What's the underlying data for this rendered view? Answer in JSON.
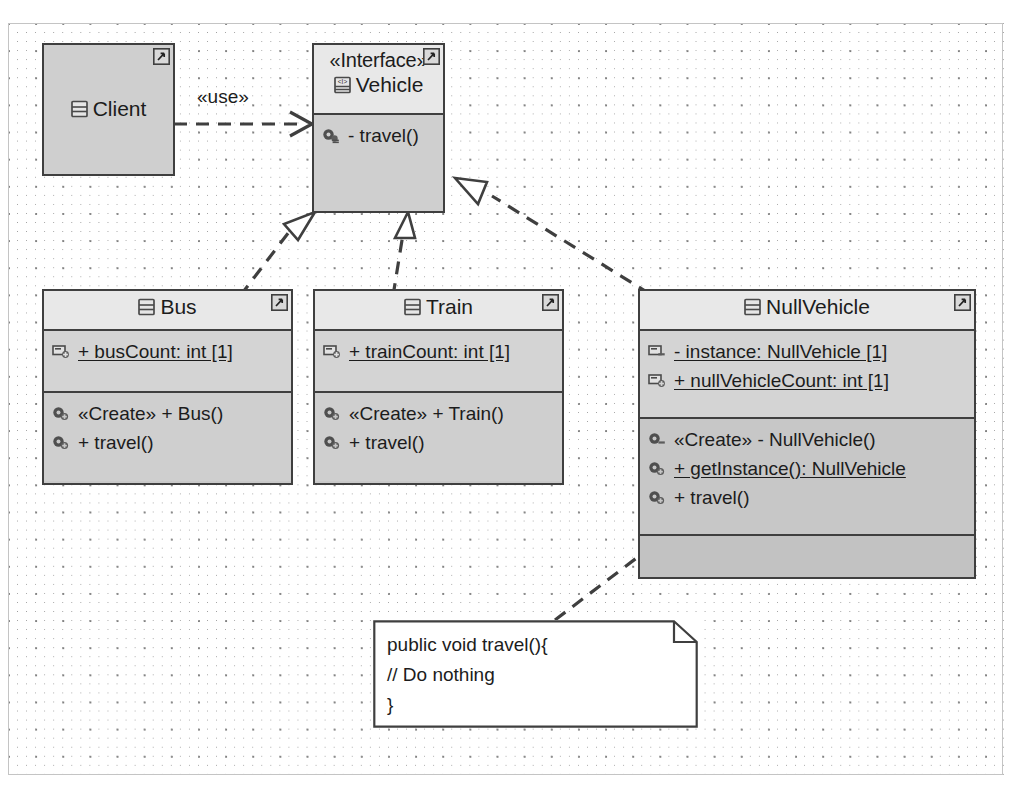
{
  "diagram": {
    "kind": "uml-class-diagram",
    "colors": {
      "class_fill": "#c9c9c9",
      "header_fill": "#e8e8e8",
      "attr_fill": "#d4d4d4",
      "op_fill": "#c7c7c7",
      "empty_fill": "#c2c2c2",
      "line": "#3f3f3f",
      "note_fill": "#ffffff",
      "grid_dot": "#6b6b6b"
    },
    "classes": [
      {
        "id": "client",
        "name": "Client",
        "stereotype": "",
        "name_icon": "class-icon",
        "corner_icon": "shortcut-icon",
        "attributes": [],
        "operations": [],
        "empty_compartments": 0
      },
      {
        "id": "vehicle",
        "name": "Vehicle",
        "stereotype": "«Interface»",
        "name_icon": "interface-icon",
        "corner_icon": "shortcut-icon",
        "attributes": [],
        "operations": [
          {
            "icon": "operation-icon",
            "text": "- travel()",
            "static": false
          }
        ],
        "empty_compartments": 0
      },
      {
        "id": "bus",
        "name": "Bus",
        "stereotype": "",
        "name_icon": "class-icon",
        "corner_icon": "shortcut-icon",
        "attributes": [
          {
            "icon": "attribute-icon",
            "text": "+ busCount: int [1]",
            "static": true
          }
        ],
        "operations": [
          {
            "icon": "operation-icon",
            "text": "«Create»  + Bus()",
            "static": false
          },
          {
            "icon": "operation-icon",
            "text": "+ travel()",
            "static": false
          }
        ],
        "empty_compartments": 0
      },
      {
        "id": "train",
        "name": "Train",
        "stereotype": "",
        "name_icon": "class-icon",
        "corner_icon": "shortcut-icon",
        "attributes": [
          {
            "icon": "attribute-icon",
            "text": "+ trainCount: int [1]",
            "static": true
          }
        ],
        "operations": [
          {
            "icon": "operation-icon",
            "text": "«Create»  + Train()",
            "static": false
          },
          {
            "icon": "operation-icon",
            "text": "+ travel()",
            "static": false
          }
        ],
        "empty_compartments": 0
      },
      {
        "id": "nullvehicle",
        "name": "NullVehicle",
        "stereotype": "",
        "name_icon": "class-icon",
        "corner_icon": "shortcut-icon",
        "attributes": [
          {
            "icon": "attribute-icon",
            "text": "- instance: NullVehicle [1]",
            "static": true
          },
          {
            "icon": "attribute-icon",
            "text": "+ nullVehicleCount: int [1]",
            "static": true
          }
        ],
        "operations": [
          {
            "icon": "operation-icon",
            "text": "«Create»  - NullVehicle()",
            "static": false
          },
          {
            "icon": "operation-icon",
            "text": "+ getInstance(): NullVehicle",
            "static": true
          },
          {
            "icon": "operation-icon",
            "text": "+ travel()",
            "static": false
          }
        ],
        "empty_compartments": 1
      }
    ],
    "note": {
      "id": "travel-note",
      "lines": [
        "public void travel(){",
        "// Do nothing",
        "}"
      ]
    },
    "connectors": [
      {
        "id": "client-uses-vehicle",
        "from": "client",
        "to": "vehicle",
        "type": "dependency",
        "label": "«use»",
        "line": "dashed",
        "arrowhead": "open-arrow"
      },
      {
        "id": "bus-realizes-vehicle",
        "from": "bus",
        "to": "vehicle",
        "type": "realization",
        "label": "",
        "line": "dashed",
        "arrowhead": "hollow-triangle"
      },
      {
        "id": "train-realizes-vehicle",
        "from": "train",
        "to": "vehicle",
        "type": "realization",
        "label": "",
        "line": "dashed",
        "arrowhead": "hollow-triangle"
      },
      {
        "id": "nullvehicle-realizes-vehicle",
        "from": "nullvehicle",
        "to": "vehicle",
        "type": "realization",
        "label": "",
        "line": "dashed",
        "arrowhead": "hollow-triangle"
      },
      {
        "id": "note-anchor-nullvehicle-travel",
        "from": "travel-note",
        "to": "nullvehicle",
        "type": "note-anchor",
        "label": "",
        "line": "dashed",
        "arrowhead": "none"
      }
    ]
  }
}
